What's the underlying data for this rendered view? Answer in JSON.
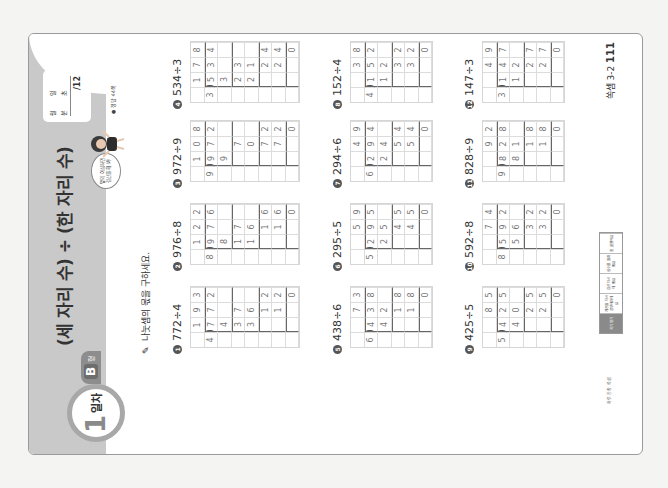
{
  "header": {
    "day_number": "1",
    "day_label": "일차",
    "type_letter": "B",
    "type_suffix": "형",
    "title": "(세 자리 수) ÷ (한 자리 수)",
    "speech_bubble": "앞의 이상하면 검산을 해 봐!",
    "score_box": {
      "month_label": "월",
      "day_label": "일",
      "minute_label": "분",
      "second_label": "초",
      "total": "/12"
    },
    "answer_reference": "● 정답 44쪽"
  },
  "instruction": "나눗셈의 몫을 구하세요.",
  "problems": [
    {
      "number": "1",
      "expression": "772÷4",
      "rows": [
        [
          "",
          "1",
          "9",
          "3"
        ],
        [
          "4",
          "7",
          "7",
          "2"
        ],
        [
          "",
          "4",
          "",
          ""
        ],
        [
          "",
          "3",
          "7",
          ""
        ],
        [
          "",
          "3",
          "6",
          ""
        ],
        [
          "",
          "",
          "1",
          "2"
        ],
        [
          "",
          "",
          "1",
          "2"
        ],
        [
          "",
          "",
          "",
          "0"
        ]
      ]
    },
    {
      "number": "2",
      "expression": "976÷8",
      "rows": [
        [
          "",
          "1",
          "2",
          "2"
        ],
        [
          "8",
          "9",
          "7",
          "6"
        ],
        [
          "",
          "8",
          "",
          ""
        ],
        [
          "",
          "1",
          "7",
          ""
        ],
        [
          "",
          "1",
          "6",
          ""
        ],
        [
          "",
          "",
          "1",
          "6"
        ],
        [
          "",
          "",
          "1",
          "6"
        ],
        [
          "",
          "",
          "",
          "0"
        ]
      ]
    },
    {
      "number": "3",
      "expression": "972÷9",
      "rows": [
        [
          "",
          "1",
          "0",
          "8"
        ],
        [
          "9",
          "9",
          "7",
          "2"
        ],
        [
          "",
          "9",
          "",
          ""
        ],
        [
          "",
          "",
          "7",
          ""
        ],
        [
          "",
          "",
          "0",
          ""
        ],
        [
          "",
          "",
          "7",
          "2"
        ],
        [
          "",
          "",
          "7",
          "2"
        ],
        [
          "",
          "",
          "",
          "0"
        ]
      ]
    },
    {
      "number": "4",
      "expression": "534÷3",
      "rows": [
        [
          "",
          "1",
          "7",
          "8"
        ],
        [
          "3",
          "5",
          "3",
          "4"
        ],
        [
          "",
          "3",
          "",
          ""
        ],
        [
          "",
          "2",
          "3",
          ""
        ],
        [
          "",
          "2",
          "1",
          ""
        ],
        [
          "",
          "",
          "2",
          "4"
        ],
        [
          "",
          "",
          "2",
          "4"
        ],
        [
          "",
          "",
          "",
          "0"
        ]
      ]
    },
    {
      "number": "5",
      "expression": "438÷6",
      "rows": [
        [
          "",
          "",
          "7",
          "3"
        ],
        [
          "6",
          "4",
          "3",
          "8"
        ],
        [
          "",
          "4",
          "2",
          ""
        ],
        [
          "",
          "",
          "1",
          "8"
        ],
        [
          "",
          "",
          "1",
          "8"
        ],
        [
          "",
          "",
          "",
          "0"
        ]
      ]
    },
    {
      "number": "6",
      "expression": "295÷5",
      "rows": [
        [
          "",
          "",
          "5",
          "9"
        ],
        [
          "5",
          "2",
          "9",
          "5"
        ],
        [
          "",
          "2",
          "5",
          ""
        ],
        [
          "",
          "",
          "4",
          "5"
        ],
        [
          "",
          "",
          "4",
          "5"
        ],
        [
          "",
          "",
          "",
          "0"
        ]
      ]
    },
    {
      "number": "7",
      "expression": "294÷6",
      "rows": [
        [
          "",
          "",
          "4",
          "9"
        ],
        [
          "6",
          "2",
          "9",
          "4"
        ],
        [
          "",
          "2",
          "4",
          ""
        ],
        [
          "",
          "",
          "5",
          "4"
        ],
        [
          "",
          "",
          "5",
          "4"
        ],
        [
          "",
          "",
          "",
          "0"
        ]
      ]
    },
    {
      "number": "8",
      "expression": "152÷4",
      "rows": [
        [
          "",
          "",
          "3",
          "8"
        ],
        [
          "4",
          "1",
          "5",
          "2"
        ],
        [
          "",
          "1",
          "2",
          ""
        ],
        [
          "",
          "",
          "3",
          "2"
        ],
        [
          "",
          "",
          "3",
          "2"
        ],
        [
          "",
          "",
          "",
          "0"
        ]
      ]
    },
    {
      "number": "9",
      "expression": "425÷5",
      "rows": [
        [
          "",
          "",
          "8",
          "5"
        ],
        [
          "5",
          "4",
          "2",
          "5"
        ],
        [
          "",
          "4",
          "0",
          ""
        ],
        [
          "",
          "",
          "2",
          "5"
        ],
        [
          "",
          "",
          "2",
          "5"
        ],
        [
          "",
          "",
          "",
          "0"
        ]
      ]
    },
    {
      "number": "10",
      "expression": "592÷8",
      "rows": [
        [
          "",
          "",
          "7",
          "4"
        ],
        [
          "8",
          "5",
          "9",
          "2"
        ],
        [
          "",
          "5",
          "6",
          ""
        ],
        [
          "",
          "",
          "3",
          "2"
        ],
        [
          "",
          "",
          "3",
          "2"
        ],
        [
          "",
          "",
          "",
          "0"
        ]
      ]
    },
    {
      "number": "11",
      "expression": "828÷9",
      "rows": [
        [
          "",
          "",
          "9",
          "2"
        ],
        [
          "9",
          "8",
          "2",
          "8"
        ],
        [
          "",
          "8",
          "1",
          ""
        ],
        [
          "",
          "",
          "1",
          "8"
        ],
        [
          "",
          "",
          "1",
          "8"
        ],
        [
          "",
          "",
          "",
          "0"
        ]
      ]
    },
    {
      "number": "12",
      "expression": "147÷3",
      "rows": [
        [
          "",
          "",
          "4",
          "9"
        ],
        [
          "3",
          "1",
          "4",
          "7"
        ],
        [
          "",
          "1",
          "2",
          ""
        ],
        [
          "",
          "",
          "2",
          "7"
        ],
        [
          "",
          "",
          "2",
          "7"
        ],
        [
          "",
          "",
          "",
          "0"
        ]
      ]
    }
  ],
  "footer": {
    "brand": "하루 한장 쏙셈",
    "evaluation_cells": [
      "자기 평가",
      "계산을 다시 공부해야해요",
      "검산 다시 해 봐요",
      "실수를 줄여 봐요",
      "참 잘했어요"
    ],
    "page_label": "쏙셈 3-2",
    "page_number": "111"
  },
  "colors": {
    "header_band": "#c9c9c9",
    "badge_ring": "#a8a8a8",
    "type_tag": "#8d8d8d",
    "grid_line": "#dcdcdc"
  }
}
